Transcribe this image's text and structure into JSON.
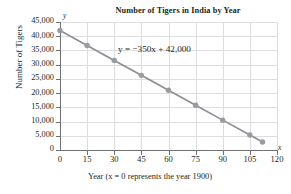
{
  "chart_data": {
    "type": "line",
    "title": "Number of Tigers in India by Year",
    "xlabel": "Year (x = 0 represents the year 1900)",
    "ylabel": "Number of Tigers",
    "annotation": "y = −350x + 42,000",
    "equation": {
      "slope": -350,
      "intercept": 42000
    },
    "xlim": [
      0,
      120
    ],
    "ylim": [
      0,
      45000
    ],
    "grid": true,
    "legend": null,
    "axis_letters": {
      "x": "x",
      "y": "y"
    },
    "xticks": [
      0,
      15,
      30,
      45,
      60,
      75,
      90,
      105,
      120
    ],
    "xtick_labels": [
      "0",
      "15",
      "30",
      "45",
      "60",
      "75",
      "90",
      "105",
      "120"
    ],
    "yticks": [
      0,
      5000,
      10000,
      15000,
      20000,
      25000,
      30000,
      35000,
      40000,
      45000
    ],
    "ytick_labels": [
      "0",
      "5,000",
      "10,000",
      "15,000",
      "20,000",
      "25,000",
      "30,000",
      "35,000",
      "40,000",
      "45,000"
    ],
    "x": [
      0,
      15,
      30,
      45,
      60,
      75,
      90,
      105,
      112
    ],
    "values": [
      42000,
      36750,
      31500,
      26250,
      21000,
      15750,
      10500,
      5250,
      2800
    ],
    "series": [
      {
        "name": "Tigers",
        "x": [
          0,
          15,
          30,
          45,
          60,
          75,
          90,
          105,
          112
        ],
        "values": [
          42000,
          36750,
          31500,
          26250,
          21000,
          15750,
          10500,
          5250,
          2800
        ]
      }
    ],
    "colors": {
      "line": "#8d8e92",
      "marker": "#9a9b9f",
      "grid": "#dcdde0",
      "axis": "#6f7073",
      "text": "#231f20"
    }
  }
}
